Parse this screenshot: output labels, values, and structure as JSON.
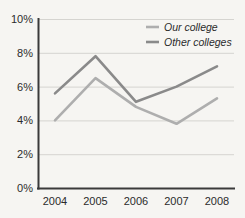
{
  "chart_data": {
    "type": "line",
    "title": "",
    "xlabel": "",
    "ylabel": "",
    "categories": [
      "2004",
      "2005",
      "2006",
      "2007",
      "2008"
    ],
    "series": [
      {
        "name": "Our college",
        "color": "#aeaeae",
        "values": [
          4.0,
          6.5,
          4.8,
          3.8,
          5.3
        ]
      },
      {
        "name": "Other colleges",
        "color": "#8a8a8a",
        "values": [
          5.6,
          7.8,
          5.1,
          6.0,
          7.2
        ]
      }
    ],
    "ylim": [
      0,
      10
    ],
    "ytick_values": [
      0,
      2,
      4,
      6,
      8,
      10
    ],
    "ytick_labels": [
      "0%",
      "2%",
      "4%",
      "6%",
      "8%",
      "10%"
    ],
    "grid": true,
    "legend_position": "top-right",
    "axis_color": "#3a3a3a",
    "grid_color": "#d5d4d0",
    "background_color": "#f6f5f2"
  }
}
